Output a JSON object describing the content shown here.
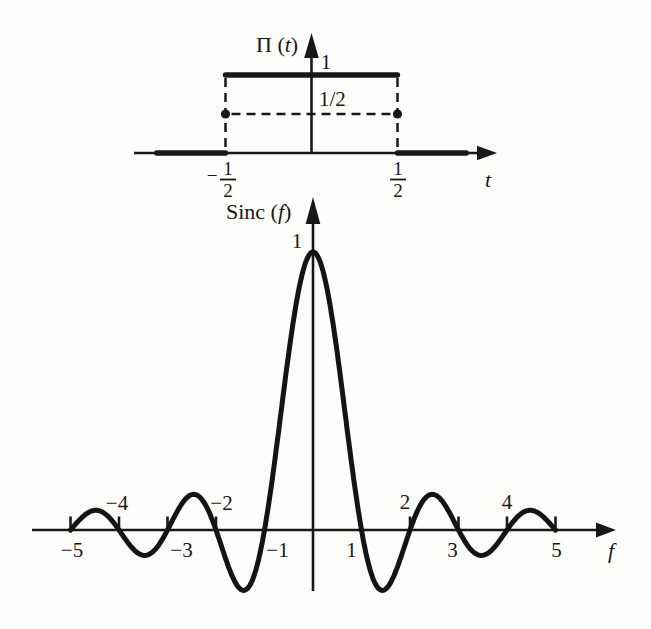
{
  "figure": {
    "background": "#fcfcfb",
    "ink": "#181818"
  },
  "chart_data": [
    {
      "type": "line",
      "id": "rect-pulse",
      "title": "Π (t)",
      "title_parts": {
        "name": "Π (",
        "var": "t",
        "close": ")"
      },
      "xlabel": "t",
      "ylabel": "Π (t)",
      "xlim": [
        -1.05,
        1.1
      ],
      "ylim": [
        0,
        1.3
      ],
      "function": "rect",
      "piecewise": [
        {
          "t_range": [
            -0.9,
            -0.5
          ],
          "value": 0
        },
        {
          "t_range": [
            -0.5,
            0.5
          ],
          "value": 1
        },
        {
          "t_range": [
            0.5,
            0.9
          ],
          "value": 0
        }
      ],
      "y_labels": [
        {
          "value": 1,
          "label": "1"
        },
        {
          "value": 0.5,
          "label": "1/2"
        }
      ],
      "x_ticks": [
        {
          "value": -0.5,
          "sign": "−",
          "num": "1",
          "den": "2"
        },
        {
          "value": 0.5,
          "sign": "",
          "num": "1",
          "den": "2"
        }
      ],
      "dashed_guides": {
        "horizontal_level": 0.5,
        "vertical_at": [
          -0.5,
          0.5
        ]
      },
      "dashed_markers": [
        {
          "x": -0.5,
          "y": 0.5
        },
        {
          "x": 0.5,
          "y": 0.5
        }
      ],
      "grid": false,
      "legend": false
    },
    {
      "type": "line",
      "id": "sinc",
      "title": "Sinc (f)",
      "title_parts": {
        "name": "Sinc (",
        "var": "f",
        "close": ")"
      },
      "xlabel": "f",
      "ylabel": "Sinc (f)",
      "function": "sinc",
      "formula": "Sinc(f) = sin(πf) / (πf)",
      "domain": [
        -5,
        5
      ],
      "ylim": [
        -0.25,
        1.1
      ],
      "peak": {
        "x": 0,
        "y": 1,
        "label": "1"
      },
      "zeros": [
        -5,
        -4,
        -3,
        -2,
        -1,
        1,
        2,
        3,
        4,
        5
      ],
      "first_sidelobe_min": -0.217,
      "axis_tick_marks": [
        -5,
        -4,
        -3,
        -2,
        2,
        3,
        4,
        5
      ],
      "x_ticks_below": [
        {
          "value": -5,
          "label": "−5"
        },
        {
          "value": -3,
          "label": "−3"
        },
        {
          "value": -1,
          "label": "−1"
        },
        {
          "value": 1,
          "label": "1"
        },
        {
          "value": 3,
          "label": "3"
        },
        {
          "value": 5,
          "label": "5"
        }
      ],
      "x_ticks_above": [
        {
          "value": -4,
          "label": "−4"
        },
        {
          "value": -2,
          "label": "−2"
        },
        {
          "value": 2,
          "label": "2"
        },
        {
          "value": 4,
          "label": "4"
        }
      ],
      "grid": false,
      "legend": false
    }
  ]
}
